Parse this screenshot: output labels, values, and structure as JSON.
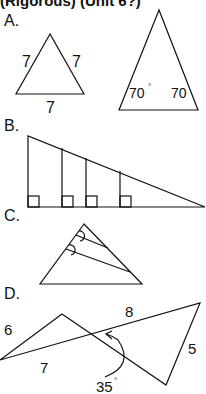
{
  "header": {
    "title": "(Rigorous) (Unit 6?)"
  },
  "sections": [
    {
      "label": "A.",
      "labels": {
        "side_left": "7",
        "side_right": "7",
        "side_bottom": "7",
        "angle_left": "70",
        "angle_right": "70",
        "degree": "°"
      }
    },
    {
      "label": "B."
    },
    {
      "label": "C."
    },
    {
      "label": "D.",
      "labels": {
        "seg_6": "6",
        "seg_7": "7",
        "seg_8": "8",
        "seg_5": "5",
        "angle": "35",
        "degree": "°"
      }
    }
  ]
}
